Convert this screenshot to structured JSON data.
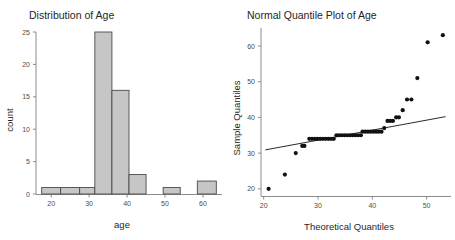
{
  "figure": {
    "background_color": "#ffffff",
    "width": 455,
    "height": 240,
    "panel_count": 2
  },
  "chart_data": [
    {
      "type": "bar",
      "subtype": "histogram",
      "title": "Distribution of Age",
      "xlabel": "age",
      "ylabel": "count",
      "xlim": [
        16,
        65
      ],
      "ylim": [
        0,
        26
      ],
      "xticks": [
        20,
        30,
        40,
        50,
        60
      ],
      "yticks": [
        0,
        5,
        10,
        15,
        20,
        25
      ],
      "grid": false,
      "legend": null,
      "bin_width": 5,
      "bin_edges": [
        17.5,
        22.5,
        27.5,
        32.5,
        37.5,
        42.5,
        47.5,
        52.5,
        57.5,
        62.5
      ],
      "bins": [
        {
          "x0": 17.5,
          "x1": 22.5,
          "count": 1
        },
        {
          "x0": 22.5,
          "x1": 27.5,
          "count": 1
        },
        {
          "x0": 27.5,
          "x1": 31.5,
          "count": 1
        },
        {
          "x0": 31.5,
          "x1": 36.0,
          "count": 25
        },
        {
          "x0": 36.0,
          "x1": 40.5,
          "count": 16
        },
        {
          "x0": 40.5,
          "x1": 45.0,
          "count": 3
        },
        {
          "x0": 45.0,
          "x1": 49.5,
          "count": 0
        },
        {
          "x0": 49.5,
          "x1": 54.0,
          "count": 1
        },
        {
          "x0": 54.0,
          "x1": 58.5,
          "count": 0
        },
        {
          "x0": 58.5,
          "x1": 63.5,
          "count": 2
        }
      ],
      "categories": [
        "17.5-22.5",
        "22.5-27.5",
        "27.5-31.5",
        "31.5-36",
        "36-40.5",
        "40.5-45",
        "45-49.5",
        "49.5-54",
        "54-58.5",
        "58.5-63.5"
      ],
      "values": [
        1,
        1,
        1,
        25,
        16,
        3,
        0,
        1,
        0,
        2
      ],
      "bar_fill": "#c6c6c6",
      "bar_stroke": "#4a4a4a"
    },
    {
      "type": "scatter",
      "subtype": "qq-plot",
      "title": "Normal Quantile Plot of Age",
      "xlabel": "Theoretical Quantiles",
      "ylabel": "Sample Quantiles",
      "xlim": [
        19.5,
        54.5
      ],
      "ylim": [
        18,
        65
      ],
      "xticks": [
        20,
        30,
        40,
        50
      ],
      "yticks": [
        20,
        30,
        40,
        50,
        60
      ],
      "grid": false,
      "legend": null,
      "point_color": "#111111",
      "reference_line": {
        "x0": 20.3,
        "y0": 30.9,
        "x1": 53.5,
        "y1": 40.2,
        "color": "#111111"
      },
      "points": [
        {
          "x": 20.9,
          "y": 20
        },
        {
          "x": 23.9,
          "y": 24
        },
        {
          "x": 25.9,
          "y": 30
        },
        {
          "x": 27.1,
          "y": 32
        },
        {
          "x": 27.5,
          "y": 32
        },
        {
          "x": 28.4,
          "y": 34
        },
        {
          "x": 28.9,
          "y": 34
        },
        {
          "x": 29.4,
          "y": 34
        },
        {
          "x": 29.9,
          "y": 34
        },
        {
          "x": 30.4,
          "y": 34
        },
        {
          "x": 30.9,
          "y": 34
        },
        {
          "x": 31.4,
          "y": 34
        },
        {
          "x": 31.9,
          "y": 34
        },
        {
          "x": 32.4,
          "y": 34
        },
        {
          "x": 32.9,
          "y": 34
        },
        {
          "x": 33.4,
          "y": 35
        },
        {
          "x": 33.9,
          "y": 35
        },
        {
          "x": 34.4,
          "y": 35
        },
        {
          "x": 34.9,
          "y": 35
        },
        {
          "x": 35.4,
          "y": 35
        },
        {
          "x": 35.9,
          "y": 35
        },
        {
          "x": 36.4,
          "y": 35
        },
        {
          "x": 36.9,
          "y": 35
        },
        {
          "x": 37.4,
          "y": 35
        },
        {
          "x": 37.9,
          "y": 35
        },
        {
          "x": 38.2,
          "y": 36
        },
        {
          "x": 38.7,
          "y": 36
        },
        {
          "x": 39.2,
          "y": 36
        },
        {
          "x": 39.7,
          "y": 36
        },
        {
          "x": 40.2,
          "y": 36
        },
        {
          "x": 40.7,
          "y": 36
        },
        {
          "x": 41.2,
          "y": 36
        },
        {
          "x": 41.7,
          "y": 36
        },
        {
          "x": 42.2,
          "y": 37
        },
        {
          "x": 42.8,
          "y": 39
        },
        {
          "x": 43.3,
          "y": 39
        },
        {
          "x": 43.8,
          "y": 39
        },
        {
          "x": 44.4,
          "y": 40
        },
        {
          "x": 44.9,
          "y": 40
        },
        {
          "x": 45.6,
          "y": 42
        },
        {
          "x": 46.4,
          "y": 45
        },
        {
          "x": 47.2,
          "y": 45
        },
        {
          "x": 48.3,
          "y": 51
        },
        {
          "x": 50.2,
          "y": 61
        },
        {
          "x": 53.0,
          "y": 63
        }
      ]
    }
  ],
  "panels": {
    "histogram": {
      "title": "Distribution of Age",
      "ylabel": "count",
      "xlabel": "age",
      "ytick_labels": [
        "0",
        "5",
        "10",
        "15",
        "20",
        "25"
      ],
      "xtick_labels": [
        "20",
        "30",
        "40",
        "50",
        "60"
      ]
    },
    "qqplot": {
      "title": "Normal Quantile Plot of Age",
      "ylabel": "Sample Quantiles",
      "xlabel": "Theoretical Quantiles",
      "ytick_labels": [
        "20",
        "30",
        "40",
        "50",
        "60"
      ],
      "xtick_labels": [
        "20",
        "30",
        "40",
        "50"
      ]
    }
  }
}
